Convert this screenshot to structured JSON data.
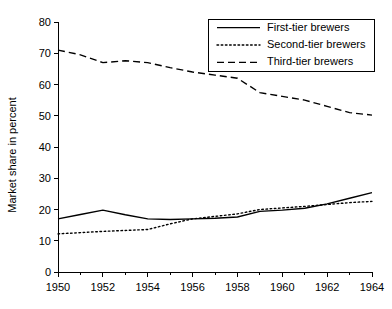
{
  "chart_data": {
    "type": "line",
    "title": "",
    "xlabel": "",
    "ylabel": "Market share in percent",
    "xlim": [
      1950,
      1964
    ],
    "ylim": [
      0,
      80
    ],
    "ytick_step": 10,
    "xtick_step": 2,
    "xminor_step": 1,
    "grid": false,
    "legend_position": "top-right",
    "x": [
      1950,
      1951,
      1952,
      1953,
      1954,
      1955,
      1956,
      1957,
      1958,
      1959,
      1960,
      1961,
      1962,
      1963,
      1964
    ],
    "yticks": [
      0,
      10,
      20,
      30,
      40,
      50,
      60,
      70,
      80
    ],
    "ytick_labels": [
      "0",
      "10",
      "20",
      "30",
      "40",
      "50",
      "60",
      "70",
      "80"
    ],
    "xticks": [
      1950,
      1952,
      1954,
      1956,
      1958,
      1960,
      1962,
      1964
    ],
    "xtick_labels": [
      "1950",
      "1952",
      "1954",
      "1956",
      "1958",
      "1960",
      "1962",
      "1964"
    ],
    "series": [
      {
        "name": "First-tier brewers",
        "style": "solid",
        "color": "#000000",
        "values": [
          17.0,
          18.4,
          19.8,
          18.3,
          17.0,
          16.8,
          17.0,
          17.2,
          17.6,
          19.4,
          19.8,
          20.4,
          21.8,
          23.6,
          25.4
        ]
      },
      {
        "name": "Second-tier brewers",
        "style": "dotted",
        "color": "#000000",
        "values": [
          12.2,
          12.6,
          13.0,
          13.3,
          13.6,
          15.4,
          17.0,
          17.8,
          18.6,
          20.0,
          20.5,
          21.0,
          21.6,
          22.2,
          22.6
        ]
      },
      {
        "name": "Third-tier brewers",
        "style": "dashed",
        "color": "#000000",
        "values": [
          71.0,
          69.5,
          67.0,
          67.6,
          67.0,
          65.4,
          64.0,
          63.0,
          62.0,
          57.4,
          56.2,
          55.0,
          53.0,
          51.0,
          50.2
        ]
      }
    ]
  },
  "legend": {
    "entries": [
      {
        "label": "First-tier brewers",
        "style": "solid"
      },
      {
        "label": "Second-tier brewers",
        "style": "dotted"
      },
      {
        "label": "Third-tier brewers",
        "style": "dashed"
      }
    ]
  }
}
